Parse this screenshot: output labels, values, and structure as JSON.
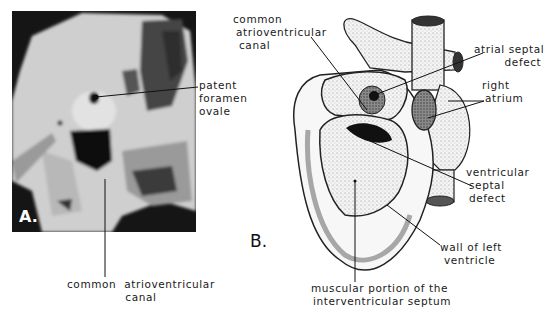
{
  "figure": {
    "panel_a": {
      "letter": "A.",
      "labels": {
        "patent_foramen_ovale": [
          "patent",
          "foramen",
          "ovale"
        ],
        "common_av_canal": [
          "common  atrioventricular",
          "canal"
        ]
      }
    },
    "panel_b": {
      "letter": "B.",
      "labels": {
        "common_av_canal": [
          "common",
          "atrioventricular",
          "canal"
        ],
        "atrial_septal_defect": [
          "atrial septal",
          "defect"
        ],
        "right_atrium": [
          "right",
          "atrium"
        ],
        "ventricular_septal_defect": [
          "ventricular",
          "septal",
          "defect"
        ],
        "wall_of_left_ventricle": [
          "wall of left",
          "ventricle"
        ],
        "muscular_portion": [
          "muscular portion of the",
          "interventricular septum"
        ]
      }
    }
  }
}
